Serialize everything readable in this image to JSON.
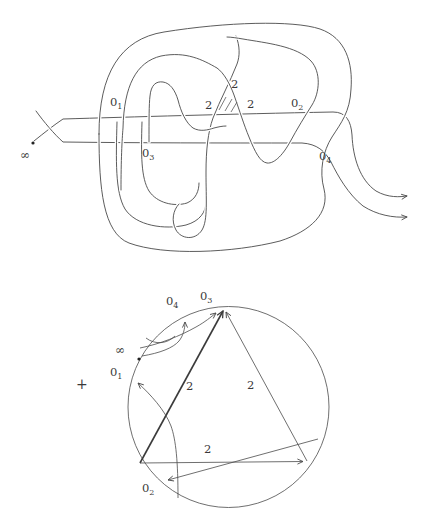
{
  "knot": {
    "labels": {
      "o1": {
        "base": "0",
        "sub": "1"
      },
      "o2": {
        "base": "0",
        "sub": "2"
      },
      "o3": {
        "base": "0",
        "sub": "3"
      },
      "o4": {
        "base": "0",
        "sub": "4"
      },
      "infinity": "∞",
      "two_left": "2",
      "two_top": "2",
      "two_right": "2"
    }
  },
  "chord_diagram": {
    "plus_sign": "+",
    "labels": {
      "o1": {
        "base": "0",
        "sub": "1"
      },
      "o2": {
        "base": "0",
        "sub": "2"
      },
      "o3": {
        "base": "0",
        "sub": "3"
      },
      "o4": {
        "base": "0",
        "sub": "4"
      },
      "infinity": "∞"
    },
    "edge_labels": {
      "left_edge": "2",
      "right_edge": "2",
      "bottom_edge": "2"
    }
  }
}
